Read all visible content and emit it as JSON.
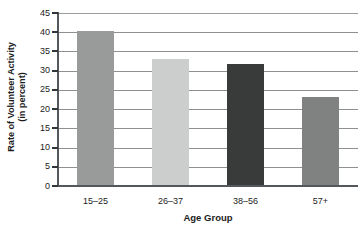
{
  "chart_data": {
    "type": "bar",
    "title": "",
    "categories": [
      "15–25",
      "26–37",
      "38–56",
      "57+"
    ],
    "values": [
      40.3,
      33.0,
      31.8,
      23.2
    ],
    "bar_colors": [
      "#999a9a",
      "#cccdcd",
      "#393a3a",
      "#808282"
    ],
    "xlabel": "Age Group",
    "ylabel": "Rate of Volunteer Activity (in percent)",
    "ylabel_line1": "Rate of Volunteer Activity",
    "ylabel_line2": "(in percent)",
    "ylim": [
      0,
      45
    ],
    "ytick_values": [
      0,
      5,
      10,
      15,
      20,
      25,
      30,
      35,
      40,
      45
    ],
    "ytick_labels": [
      "0",
      "5",
      "10",
      "15",
      "20",
      "25",
      "30",
      "35",
      "40",
      "45"
    ],
    "grid": true,
    "grid_axis": "y",
    "legend": false,
    "legend_position": "none",
    "top_crop_artifact": "",
    "axis_color": "#55585a",
    "grid_color": "#8e9090",
    "text_color": "#1c1c1c",
    "background": "#ffffff"
  }
}
